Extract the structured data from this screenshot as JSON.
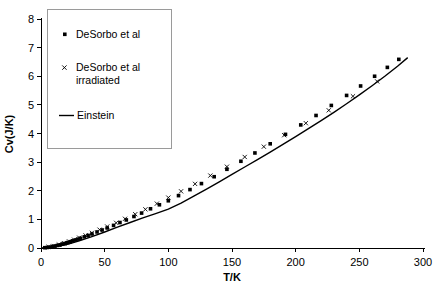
{
  "chart_data": {
    "type": "scatter",
    "title": "",
    "xlabel": "T/K",
    "ylabel": "Cv(J/K)",
    "xlim": [
      0,
      300
    ],
    "ylim": [
      0,
      8
    ],
    "xticks": [
      0,
      50,
      100,
      150,
      200,
      250,
      300
    ],
    "yticks": [
      0,
      1,
      2,
      3,
      4,
      5,
      6,
      7,
      8
    ],
    "grid": false,
    "legend_position": "top-left",
    "series": [
      {
        "name": "DeSorbo et al",
        "marker": "filled-square",
        "color": "#000000",
        "x": [
          3,
          5,
          7,
          9,
          11,
          13,
          15,
          17,
          19,
          21,
          23,
          25,
          27,
          29,
          31,
          34,
          37,
          40,
          44,
          48,
          52,
          57,
          62,
          67,
          73,
          79,
          86,
          93,
          100,
          108,
          117,
          126,
          136,
          146,
          157,
          168,
          180,
          192,
          204,
          216,
          228,
          240,
          251,
          262,
          272,
          281
        ],
        "y": [
          0.01,
          0.02,
          0.03,
          0.05,
          0.07,
          0.09,
          0.11,
          0.14,
          0.16,
          0.19,
          0.22,
          0.25,
          0.28,
          0.31,
          0.34,
          0.39,
          0.44,
          0.49,
          0.56,
          0.63,
          0.7,
          0.79,
          0.89,
          0.98,
          1.1,
          1.22,
          1.37,
          1.51,
          1.65,
          1.83,
          2.04,
          2.25,
          2.49,
          2.75,
          3.03,
          3.32,
          3.64,
          3.97,
          4.3,
          4.63,
          4.98,
          5.33,
          5.66,
          6.0,
          6.31,
          6.59
        ]
      },
      {
        "name": "DeSorbo et al irradiated",
        "marker": "cross-x",
        "color": "#000000",
        "x": [
          6,
          10,
          14,
          18,
          22,
          26,
          30,
          35,
          40,
          46,
          52,
          59,
          66,
          74,
          82,
          91,
          100,
          110,
          121,
          133,
          146,
          160,
          175,
          191,
          208,
          226,
          245,
          264
        ],
        "y": [
          0.04,
          0.07,
          0.12,
          0.17,
          0.23,
          0.29,
          0.36,
          0.44,
          0.53,
          0.64,
          0.75,
          0.88,
          1.02,
          1.18,
          1.35,
          1.55,
          1.76,
          1.98,
          2.24,
          2.53,
          2.84,
          3.18,
          3.54,
          3.94,
          4.36,
          4.81,
          5.3,
          5.82
        ]
      }
    ],
    "model": {
      "name": "Einstein",
      "style": "solid-line",
      "color": "#000000",
      "x": [
        0,
        10,
        20,
        30,
        40,
        50,
        60,
        70,
        80,
        90,
        100,
        110,
        120,
        130,
        140,
        150,
        160,
        170,
        180,
        190,
        200,
        210,
        220,
        230,
        240,
        250,
        260,
        270,
        280,
        288
      ],
      "y": [
        0.0,
        0.03,
        0.12,
        0.25,
        0.4,
        0.56,
        0.73,
        0.89,
        1.05,
        1.2,
        1.36,
        1.57,
        1.81,
        2.06,
        2.31,
        2.57,
        2.83,
        3.09,
        3.35,
        3.62,
        3.89,
        4.17,
        4.45,
        4.74,
        5.04,
        5.35,
        5.67,
        6.0,
        6.35,
        6.65
      ]
    }
  },
  "legend": {
    "entries": [
      {
        "label": "DeSorbo et al",
        "label2": "",
        "marker": "filled-square"
      },
      {
        "label": "DeSorbo et al",
        "label2": "irradiated",
        "marker": "cross-x"
      },
      {
        "label": "Einstein",
        "label2": "",
        "marker": "line"
      }
    ]
  },
  "axes": {
    "x_title": "T/K",
    "y_title": "Cv(J/K)",
    "x_tick_labels": [
      "0",
      "50",
      "100",
      "150",
      "200",
      "250",
      "300"
    ],
    "y_tick_labels": [
      "0",
      "1",
      "2",
      "3",
      "4",
      "5",
      "6",
      "7",
      "8"
    ]
  }
}
